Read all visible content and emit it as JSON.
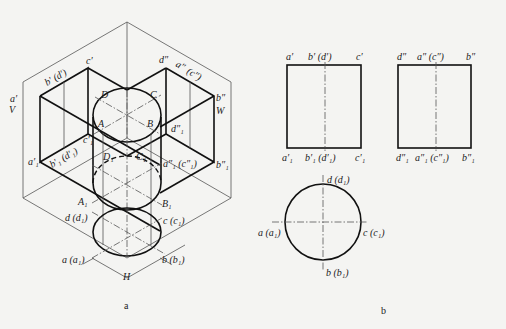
{
  "figure": {
    "part_a": {
      "caption": "a",
      "planes": {
        "V": "V",
        "W": "W",
        "H": "H"
      },
      "labels": {
        "a_prime": "a′",
        "b_prime_d_prime": "b′ (d′)",
        "c_prime": "c′",
        "d_dprime": "d″",
        "a_dprime": "a″",
        "c_dprime_paren": "(c″)",
        "b_dprime": "b″",
        "D": "D",
        "C": "C",
        "A": "A",
        "B": "B",
        "d1_dprime": "d″₁",
        "a1_prime": "a′₁",
        "b1_prime_d1_prime": "b′₁ (d′₁)",
        "c1_prime": "c′₁",
        "D1": "D₁",
        "C1": "C₁",
        "a1_dprime_c1_dprime": "a″₁ (c″₁)",
        "b1_dprime": "b″₁",
        "A1": "A₁",
        "B1": "B₁",
        "d_d1": "d (d₁)",
        "c_c1": "c (c₁)",
        "a_a1": "a (a₁)",
        "b_b1": "b (b₁)"
      }
    },
    "part_b": {
      "caption": "b",
      "front_view": {
        "top_labels": [
          "a′",
          "b′ (d′)",
          "c′"
        ],
        "bottom_labels": [
          "a′₁",
          "b′₁ (d′₁)",
          "c′₁"
        ]
      },
      "side_view": {
        "top_labels": [
          "d″",
          "a″ (c″)",
          "b″"
        ],
        "bottom_labels": [
          "d″₁",
          "a″₁ (c″₁)",
          "b″₁"
        ]
      },
      "top_view": {
        "labels": {
          "top": "d (d₁)",
          "left": "a (a₁)",
          "right": "c (c₁)",
          "bottom": "b (b₁)"
        }
      }
    }
  }
}
